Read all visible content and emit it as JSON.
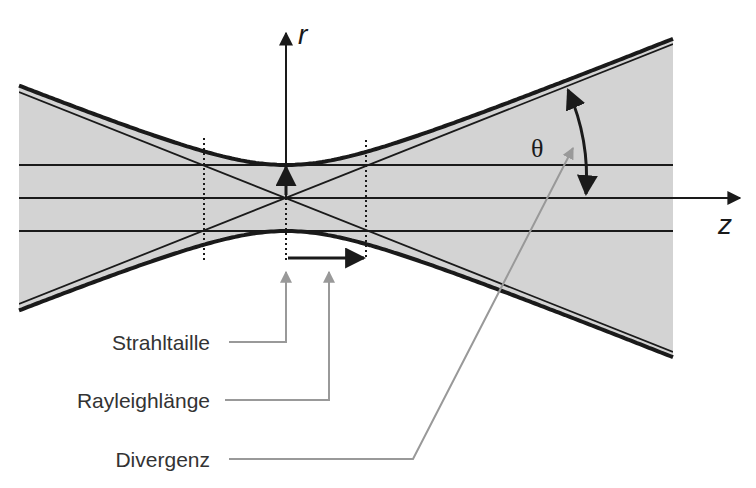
{
  "diagram": {
    "type": "gaussian-beam",
    "axes": {
      "r_label": "r",
      "z_label": "z"
    },
    "angle_symbol": "θ",
    "callouts": [
      {
        "id": "beam-waist",
        "label": "Strahltaille"
      },
      {
        "id": "rayleigh-length",
        "label": "Rayleighlänge"
      },
      {
        "id": "divergence",
        "label": "Divergenz"
      }
    ],
    "colors": {
      "beam_fill": "#d3d3d3",
      "outline": "#1a1a1a",
      "callout_line": "#999999",
      "text": "#333333"
    }
  }
}
